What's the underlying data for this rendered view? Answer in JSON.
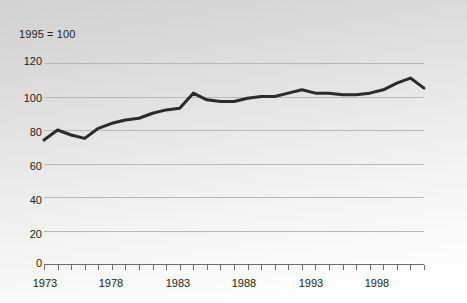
{
  "chart_data": {
    "type": "line",
    "title": "",
    "subtitle": "",
    "annotation": "1995 = 100",
    "xlabel": "",
    "ylabel": "",
    "xlim": [
      1973,
      2001
    ],
    "ylim": [
      0,
      120
    ],
    "grid": true,
    "legend": null,
    "yticks": [
      0,
      20,
      40,
      60,
      80,
      100,
      120
    ],
    "ytick_labels": [
      "0",
      "20",
      "40",
      "60",
      "80",
      "100",
      "120"
    ],
    "xtick_labels": [
      "1973",
      "1978",
      "1983",
      "1988",
      "1993",
      "1998"
    ],
    "xtick_values": [
      1973,
      1978,
      1983,
      1988,
      1993,
      1998
    ],
    "minor_tick_interval": 1,
    "series": [
      {
        "name": "Index",
        "color": "#2b2b2b",
        "line_width": 3,
        "x": [
          1973,
          1974,
          1975,
          1976,
          1977,
          1978,
          1979,
          1980,
          1981,
          1982,
          1983,
          1984,
          1985,
          1986,
          1987,
          1988,
          1989,
          1990,
          1991,
          1992,
          1993,
          1994,
          1995,
          1996,
          1997,
          1998,
          1999,
          2000,
          2001
        ],
        "values": [
          74,
          80,
          77,
          75,
          81,
          84,
          86,
          87,
          90,
          92,
          93,
          102,
          98,
          97,
          97,
          99,
          100,
          100,
          102,
          104,
          102,
          102,
          101,
          101,
          102,
          104,
          108,
          111,
          105
        ]
      }
    ]
  },
  "axis_colors": {
    "grid": "#b8b8b8",
    "axis": "#6d6d6d",
    "text": "#222222",
    "line": "#2b2b2b"
  }
}
